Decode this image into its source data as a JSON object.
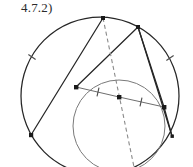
{
  "figure": {
    "label": "4.7.2)",
    "caption_position": "top-left",
    "background_color": "#ffffff",
    "ink_color": "#262626",
    "secondary_ink_color": "#6e6e6e",
    "width": 193,
    "height": 167
  },
  "diagram": {
    "type": "euclidean-geometry-construction",
    "circles": [
      {
        "name": "circumcircle",
        "cx": 100,
        "cy": 96,
        "r": 79,
        "stroke": "#262626",
        "stroke_width": 1.25,
        "dashed": false
      },
      {
        "name": "inner-circle",
        "cx": 119,
        "cy": 126,
        "r": 46,
        "stroke": "#7a7a7a",
        "stroke_width": 1.0,
        "dashed": false
      }
    ],
    "points": [
      {
        "name": "top-vertex",
        "x": 103,
        "y": 18,
        "marker": "square",
        "size": 4
      },
      {
        "name": "upper-right-vertex",
        "x": 138,
        "y": 27,
        "marker": "square",
        "size": 4
      },
      {
        "name": "chord-left-vertex",
        "x": 76,
        "y": 87,
        "marker": "square",
        "size": 4
      },
      {
        "name": "chord-midpoint",
        "x": 119,
        "y": 97,
        "marker": "square",
        "size": 4
      },
      {
        "name": "chord-right-vertex",
        "x": 164,
        "y": 107,
        "marker": "square",
        "size": 4
      },
      {
        "name": "lower-left-vertex",
        "x": 31,
        "y": 135,
        "marker": "square",
        "size": 4
      },
      {
        "name": "lower-right-vertex",
        "x": 172,
        "y": 136,
        "marker": "square",
        "size": 3
      }
    ],
    "segments": [
      {
        "name": "chord-left-to-mid",
        "x1": 76,
        "y1": 87,
        "x2": 119,
        "y2": 97,
        "stroke": "#6e6e6e",
        "width": 1.0,
        "dashed": false
      },
      {
        "name": "chord-mid-to-right",
        "x1": 119,
        "y1": 97,
        "x2": 164,
        "y2": 107,
        "stroke": "#6e6e6e",
        "width": 1.0,
        "dashed": false
      },
      {
        "name": "side-topvertex-left",
        "x1": 103,
        "y1": 18,
        "x2": 31,
        "y2": 135,
        "stroke": "#262626",
        "width": 1.25,
        "dashed": false
      },
      {
        "name": "side-upperright-left",
        "x1": 138,
        "y1": 27,
        "x2": 76,
        "y2": 87,
        "stroke": "#262626",
        "width": 1.25,
        "dashed": false
      },
      {
        "name": "side-upperright-lowerright",
        "x1": 138,
        "y1": 27,
        "x2": 172,
        "y2": 136,
        "stroke": "#262626",
        "width": 1.25,
        "dashed": false
      },
      {
        "name": "side-upperright-chordright",
        "x1": 138,
        "y1": 27,
        "x2": 164,
        "y2": 107,
        "stroke": "#262626",
        "width": 1.25,
        "dashed": false
      },
      {
        "name": "side-chordright-lowerright",
        "x1": 164,
        "y1": 107,
        "x2": 172,
        "y2": 136,
        "stroke": "#262626",
        "width": 1.25,
        "dashed": false
      },
      {
        "name": "cevian-dashed",
        "x1": 103,
        "y1": 18,
        "x2": 134,
        "y2": 167,
        "stroke": "#8a8a8a",
        "width": 1.1,
        "dashed": true,
        "dash_pattern": "4 3"
      }
    ],
    "tick_marks": [
      {
        "name": "tick-chord-left-segment",
        "x": 98,
        "y": 92,
        "angle": 13,
        "length": 9,
        "stroke": "#4a4a4a"
      },
      {
        "name": "tick-chord-right-segment",
        "x": 141,
        "y": 102,
        "angle": 13,
        "length": 9,
        "stroke": "#4a4a4a"
      },
      {
        "name": "tick-arc-left",
        "x": 32,
        "y": 57,
        "angle": -55,
        "length": 9,
        "stroke": "#4a4a4a"
      },
      {
        "name": "tick-arc-right",
        "x": 170,
        "y": 58,
        "angle": 55,
        "length": 9,
        "stroke": "#4a4a4a"
      }
    ]
  }
}
